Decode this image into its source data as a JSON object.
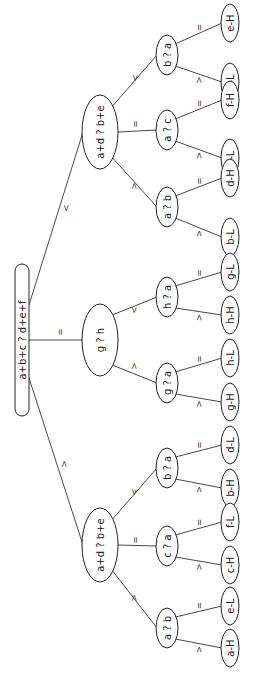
{
  "diagram": {
    "title": "",
    "orientation": "rotated-90-ccw",
    "colors": {
      "line": "#333333",
      "text": "#222222",
      "background": "#ffffff"
    },
    "root": {
      "id": "root",
      "label": "a+b+c  ?  d+e+f",
      "shape": "pill",
      "x": 22,
      "y": 340,
      "rx": 7,
      "ry": 76
    },
    "level1": [
      {
        "id": "n1_lt",
        "label": "a+d ? b+e",
        "x": 100,
        "y": 132,
        "rx": 18,
        "ry": 37
      },
      {
        "id": "n1_eq",
        "label": "g  ?  h",
        "x": 100,
        "y": 340,
        "rx": 18,
        "ry": 36
      },
      {
        "id": "n1_gt",
        "label": "a+d ? b+e",
        "x": 100,
        "y": 545,
        "rx": 18,
        "ry": 37
      }
    ],
    "level2": [
      {
        "id": "n2_1",
        "parent": "n1_lt",
        "label": "b ? a",
        "x": 167,
        "y": 55,
        "rx": 11,
        "ry": 20
      },
      {
        "id": "n2_2",
        "parent": "n1_lt",
        "label": "a ? c",
        "x": 167,
        "y": 130,
        "rx": 11,
        "ry": 20
      },
      {
        "id": "n2_3",
        "parent": "n1_lt",
        "label": "a ? b",
        "x": 167,
        "y": 207,
        "rx": 11,
        "ry": 20
      },
      {
        "id": "n2_4",
        "parent": "n1_eq",
        "label": "h ? a",
        "x": 167,
        "y": 297,
        "rx": 11,
        "ry": 20
      },
      {
        "id": "n2_5",
        "parent": "n1_eq",
        "label": "g ? a",
        "x": 167,
        "y": 383,
        "rx": 11,
        "ry": 20
      },
      {
        "id": "n2_6",
        "parent": "n1_gt",
        "label": "b ? a",
        "x": 167,
        "y": 468,
        "rx": 11,
        "ry": 20
      },
      {
        "id": "n2_7",
        "parent": "n1_gt",
        "label": "c ? a",
        "x": 167,
        "y": 546,
        "rx": 11,
        "ry": 20
      },
      {
        "id": "n2_8",
        "parent": "n1_gt",
        "label": "a ? b",
        "x": 167,
        "y": 628,
        "rx": 11,
        "ry": 20
      }
    ],
    "leaves": [
      {
        "parent": "n2_1",
        "label": "e-H",
        "x": 230,
        "y": 23,
        "edge": "="
      },
      {
        "parent": "n2_1",
        "label": "a-L",
        "x": 230,
        "y": 82,
        "edge": ">"
      },
      {
        "parent": "n2_2",
        "label": "f-H",
        "x": 230,
        "y": 100,
        "edge": "="
      },
      {
        "parent": "n2_2",
        "label": "c-L",
        "x": 230,
        "y": 158,
        "edge": ">"
      },
      {
        "parent": "n2_3",
        "label": "d-H",
        "x": 230,
        "y": 178,
        "edge": "="
      },
      {
        "parent": "n2_3",
        "label": "b-L",
        "x": 230,
        "y": 237,
        "edge": ">"
      },
      {
        "parent": "n2_4",
        "label": "g-L",
        "x": 230,
        "y": 272,
        "edge": "="
      },
      {
        "parent": "n2_4",
        "label": "h-H",
        "x": 230,
        "y": 315,
        "edge": ">"
      },
      {
        "parent": "n2_5",
        "label": "h-L",
        "x": 230,
        "y": 358,
        "edge": "="
      },
      {
        "parent": "n2_5",
        "label": "g-H",
        "x": 230,
        "y": 402,
        "edge": ">"
      },
      {
        "parent": "n2_6",
        "label": "d-L",
        "x": 230,
        "y": 445,
        "edge": "="
      },
      {
        "parent": "n2_6",
        "label": "b-H",
        "x": 230,
        "y": 488,
        "edge": ">"
      },
      {
        "parent": "n2_7",
        "label": "f-L",
        "x": 230,
        "y": 522,
        "edge": "="
      },
      {
        "parent": "n2_7",
        "label": "c-H",
        "x": 230,
        "y": 565,
        "edge": ">"
      },
      {
        "parent": "n2_8",
        "label": "e-L",
        "x": 230,
        "y": 606,
        "edge": "="
      },
      {
        "parent": "n2_8",
        "label": "a-H",
        "x": 230,
        "y": 648,
        "edge": ">"
      }
    ],
    "leaf_size": {
      "rx": 9,
      "ry": 19
    },
    "root_edges": [
      {
        "to": "n1_lt",
        "label": "<",
        "from": [
          29,
          305
        ],
        "labelPos": [
          66,
          208
        ]
      },
      {
        "to": "n1_eq",
        "label": "=",
        "from": [
          29,
          340
        ],
        "labelPos": [
          60,
          332
        ]
      },
      {
        "to": "n1_gt",
        "label": ">",
        "from": [
          29,
          378
        ],
        "labelPos": [
          64,
          464
        ]
      }
    ],
    "level1_edges": [
      {
        "from": "n1_lt",
        "to": "n2_1",
        "label": "<",
        "labelPos": [
          135,
          78
        ]
      },
      {
        "from": "n1_lt",
        "to": "n2_2",
        "label": "=",
        "labelPos": [
          135,
          124
        ]
      },
      {
        "from": "n1_lt",
        "to": "n2_3",
        "label": ">",
        "labelPos": [
          134,
          186
        ]
      },
      {
        "from": "n1_eq",
        "to": "n2_4",
        "label": "<",
        "labelPos": [
          134,
          310
        ]
      },
      {
        "from": "n1_eq",
        "to": "n2_5",
        "label": ">",
        "labelPos": [
          134,
          366
        ]
      },
      {
        "from": "n1_gt",
        "to": "n2_6",
        "label": "<",
        "labelPos": [
          134,
          492
        ]
      },
      {
        "from": "n1_gt",
        "to": "n2_7",
        "label": "=",
        "labelPos": [
          135,
          540
        ]
      },
      {
        "from": "n1_gt",
        "to": "n2_8",
        "label": ">",
        "labelPos": [
          134,
          598
        ]
      }
    ]
  }
}
